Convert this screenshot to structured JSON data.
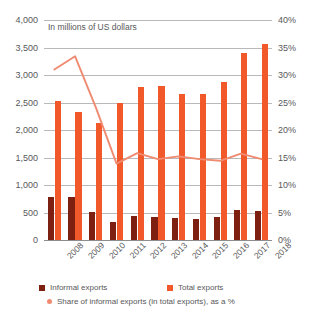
{
  "subtitle": "In millions of US dollars",
  "legend": {
    "informal_label": "Informal exports",
    "total_label": "Total exports",
    "share_label": "Share of informal exports (in total exports), as a %"
  },
  "colors": {
    "informal": "#7d1f11",
    "total": "#f1592a",
    "share_line": "#f08a70",
    "gridline": "#b9b9bb",
    "text": "#58585a"
  },
  "axes": {
    "left_ticks": [
      "4,000",
      "3,500",
      "3,000",
      "2,500",
      "2,000",
      "1,500",
      "1,000",
      "500",
      "0"
    ],
    "right_ticks": [
      "40%",
      "35%",
      "30%",
      "25%",
      "20%",
      "15%",
      "10%",
      "5%",
      "0%"
    ]
  },
  "chart_data": {
    "type": "bar",
    "title": "",
    "subtitle": "In millions of US dollars",
    "xlabel": "",
    "ylabel": "In millions of US dollars",
    "y2label": "as a %",
    "grid": true,
    "legend_position": "bottom",
    "categories": [
      "2008",
      "2009",
      "2010",
      "2011",
      "2012",
      "2013",
      "2014",
      "2015",
      "2016",
      "2017",
      "2018"
    ],
    "ylim": [
      0,
      4000
    ],
    "y2lim": [
      0,
      40
    ],
    "series": [
      {
        "name": "Informal exports",
        "type": "bar",
        "axis": "left",
        "color": "#7d1f11",
        "values": [
          780,
          775,
          510,
          320,
          435,
          410,
          405,
          390,
          415,
          540,
          525
        ]
      },
      {
        "name": "Total exports",
        "type": "bar",
        "axis": "left",
        "color": "#f1592a",
        "values": [
          2520,
          2320,
          2120,
          2500,
          2790,
          2805,
          2650,
          2655,
          2880,
          3400,
          3560
        ]
      },
      {
        "name": "Share of informal exports (in total exports), as a %",
        "type": "line",
        "axis": "right",
        "color": "#f08a70",
        "values": [
          31.0,
          33.4,
          24.1,
          13.9,
          15.8,
          14.7,
          15.2,
          14.7,
          14.4,
          15.7,
          14.7
        ]
      }
    ]
  }
}
